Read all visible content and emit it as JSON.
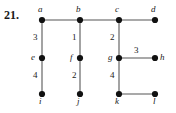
{
  "figure": {
    "problem_number": "21.",
    "edge_color": "#8c8c8c",
    "vertex_color": "#111111",
    "label_color": "#1a1a1a",
    "background": "#ffffff"
  },
  "graph": {
    "vertices": [
      {
        "id": "a",
        "label": "a",
        "x": 42,
        "y": 20,
        "label_x": 38,
        "label_y": 5,
        "label_pos": "above-left"
      },
      {
        "id": "b",
        "label": "b",
        "x": 80,
        "y": 20,
        "label_x": 76,
        "label_y": 5,
        "label_pos": "above-left"
      },
      {
        "id": "c",
        "label": "c",
        "x": 119,
        "y": 20,
        "label_x": 115,
        "label_y": 5,
        "label_pos": "above-left"
      },
      {
        "id": "d",
        "label": "d",
        "x": 155,
        "y": 20,
        "label_x": 151,
        "label_y": 5,
        "label_pos": "above-left"
      },
      {
        "id": "e",
        "label": "e",
        "x": 42,
        "y": 58,
        "label_x": 31,
        "label_y": 53,
        "label_pos": "left"
      },
      {
        "id": "f",
        "label": "f",
        "x": 80,
        "y": 58,
        "label_x": 70,
        "label_y": 53,
        "label_pos": "left"
      },
      {
        "id": "g",
        "label": "g",
        "x": 119,
        "y": 58,
        "label_x": 108,
        "label_y": 53,
        "label_pos": "left"
      },
      {
        "id": "h",
        "label": "h",
        "x": 155,
        "y": 58,
        "label_x": 160,
        "label_y": 53,
        "label_pos": "right"
      },
      {
        "id": "i",
        "label": "i",
        "x": 42,
        "y": 94,
        "label_x": 39,
        "label_y": 97,
        "label_pos": "below"
      },
      {
        "id": "j",
        "label": "j",
        "x": 80,
        "y": 94,
        "label_x": 77,
        "label_y": 97,
        "label_pos": "below"
      },
      {
        "id": "k",
        "label": "k",
        "x": 119,
        "y": 94,
        "label_x": 115,
        "label_y": 97,
        "label_pos": "below"
      },
      {
        "id": "l",
        "label": "l",
        "x": 155,
        "y": 94,
        "label_x": 153,
        "label_y": 97,
        "label_pos": "below"
      }
    ],
    "edges": [
      {
        "from": "a",
        "to": "b",
        "weight": null,
        "weight_x": null,
        "weight_y": null
      },
      {
        "from": "b",
        "to": "c",
        "weight": null,
        "weight_x": null,
        "weight_y": null
      },
      {
        "from": "c",
        "to": "d",
        "weight": null,
        "weight_x": null,
        "weight_y": null
      },
      {
        "from": "a",
        "to": "e",
        "weight": "3",
        "weight_x": 33,
        "weight_y": 33
      },
      {
        "from": "b",
        "to": "f",
        "weight": "1",
        "weight_x": 72,
        "weight_y": 33
      },
      {
        "from": "c",
        "to": "g",
        "weight": "2",
        "weight_x": 110,
        "weight_y": 33
      },
      {
        "from": "g",
        "to": "h",
        "weight": "3",
        "weight_x": 134,
        "weight_y": 46
      },
      {
        "from": "e",
        "to": "i",
        "weight": "4",
        "weight_x": 33,
        "weight_y": 71
      },
      {
        "from": "f",
        "to": "j",
        "weight": "2",
        "weight_x": 72,
        "weight_y": 71
      },
      {
        "from": "g",
        "to": "k",
        "weight": "4",
        "weight_x": 110,
        "weight_y": 71
      },
      {
        "from": "k",
        "to": "l",
        "weight": null,
        "weight_x": null,
        "weight_y": null
      }
    ]
  }
}
